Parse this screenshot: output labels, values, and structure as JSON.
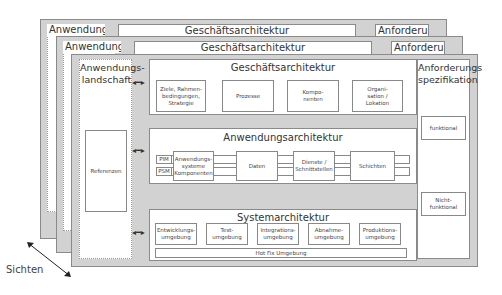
{
  "layers_back": [
    {
      "landscape_label": "Anwendungs-",
      "business_label": "Geschäftsarchitektur",
      "requirements_label": "Anforderungs"
    },
    {
      "landscape_label": "Anwendungs-",
      "business_label": "Geschäftsarchitektur",
      "requirements_label": "Anforderungs"
    }
  ],
  "front_layer": {
    "landscape": {
      "title": "Anwendungs-\nlandschaft",
      "references": "Referenzen"
    },
    "business": {
      "title": "Geschäftsarchitektur",
      "boxes": [
        "Ziele, Rahmen-\nbedingungen,\nStrategie",
        "Prozesse",
        "Kompo-\nnenten",
        "Organi-\nsation /\nLokation"
      ]
    },
    "application": {
      "title": "Anwendungsarchitektur",
      "pim": "PIM",
      "psm": "PSM",
      "boxes": [
        "Anwendungs-\nsysteme\nKomponenten",
        "Daten",
        "Dienste /\nSchnittstellen",
        "Schichten"
      ]
    },
    "system": {
      "title": "Systemarchitektur",
      "boxes": [
        "Entwicklungs-\numgebung",
        "Test-\numgebung",
        "Integrations-\numgebung",
        "Abnahme-\numgebung",
        "Produktions-\numgebung"
      ],
      "hotfix": "Hot Fix Umgebung"
    },
    "requirements": {
      "title": "Anforderungs\nspezifikation",
      "boxes": [
        "funktional",
        "Nicht-\nfunktional"
      ]
    }
  },
  "views_label": "Sichten",
  "arrow_glyph": "◂━▸"
}
